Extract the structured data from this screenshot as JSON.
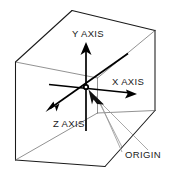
{
  "diagram": {
    "background_color": "#ffffff",
    "line_color": "#1a1a1a",
    "thin_line_color": "#6e6e6e",
    "leader_color": "#9a9a9a",
    "labels": {
      "y_axis": "Y AXIS",
      "x_axis": "X AXIS",
      "z_axis": "Z AXIS",
      "origin": "ORIGIN"
    },
    "elements": {
      "cube_name": "wireframe-cube",
      "origin_marker_name": "origin-point",
      "pointer_name": "origin-pointer-arrow"
    }
  }
}
